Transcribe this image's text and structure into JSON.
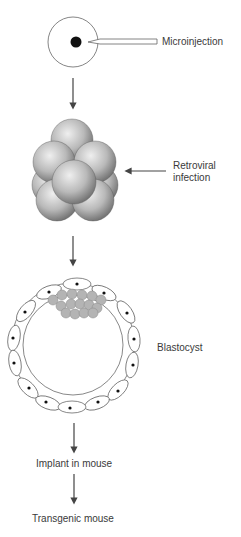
{
  "diagram": {
    "type": "flow",
    "steps": [
      {
        "id": "zygote",
        "label": "Microinjection"
      },
      {
        "id": "morula",
        "label_line1": "Retroviral",
        "label_line2": "infection"
      },
      {
        "id": "blastocyst",
        "label": "Blastocyst"
      },
      {
        "id": "implant",
        "label": "Implant in mouse"
      },
      {
        "id": "result",
        "label": "Transgenic mouse"
      }
    ],
    "colors": {
      "stroke": "#555555",
      "arrow": "#444444",
      "inner_cell_mass": "#b4b4b4",
      "sphere_light": "#e6e6e6",
      "sphere_dark": "#6e6e6e"
    }
  }
}
